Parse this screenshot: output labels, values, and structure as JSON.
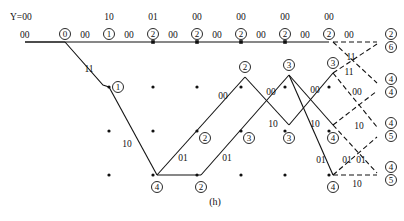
{
  "diagram": {
    "type": "viterbi-trellis",
    "caption": "(h)",
    "received_label": "Y=00",
    "received_sequence": [
      "00",
      "10",
      "01",
      "00",
      "00",
      "00",
      "00"
    ],
    "upper_labels": [
      "Y=00",
      "10",
      "01",
      "00",
      "00",
      "00",
      "00"
    ],
    "lower_labels": [
      "00",
      "00",
      "00",
      "00",
      "00",
      "00",
      "00",
      "00"
    ],
    "columns_x": [
      65,
      109,
      153,
      197,
      241,
      285,
      329,
      373
    ],
    "rows_y": [
      42,
      87,
      131,
      175
    ],
    "survivor_edges": [
      {
        "from": [
          0,
          0
        ],
        "to": [
          1,
          0
        ],
        "label": "00"
      },
      {
        "from": [
          1,
          0
        ],
        "to": [
          2,
          0
        ],
        "label": "00"
      },
      {
        "from": [
          2,
          0
        ],
        "to": [
          3,
          0
        ],
        "label": "00"
      },
      {
        "from": [
          3,
          0
        ],
        "to": [
          4,
          0
        ],
        "label": "00"
      },
      {
        "from": [
          4,
          0
        ],
        "to": [
          5,
          0
        ],
        "label": "00"
      },
      {
        "from": [
          5,
          0
        ],
        "to": [
          6,
          0
        ],
        "label": "00"
      },
      {
        "from": [
          0,
          0
        ],
        "to": [
          1,
          1
        ],
        "label": "11"
      },
      {
        "from": [
          1,
          1
        ],
        "to": [
          2,
          3
        ],
        "label": "10"
      },
      {
        "from": [
          2,
          3
        ],
        "to": [
          3,
          3
        ],
        "label": ""
      },
      {
        "from": [
          2,
          3
        ],
        "to": [
          4,
          1
        ],
        "label": "01"
      },
      {
        "from": [
          3,
          3
        ],
        "to": [
          5,
          1
        ],
        "label": "01"
      },
      {
        "from": [
          4,
          1
        ],
        "to": [
          5,
          2
        ],
        "label": "10"
      },
      {
        "from": [
          5,
          1
        ],
        "to": [
          6,
          2
        ],
        "label": "10"
      },
      {
        "from": [
          5,
          1
        ],
        "to": [
          6,
          3
        ],
        "label": "01"
      },
      {
        "from": [
          4,
          1
        ],
        "to": [
          5,
          1
        ],
        "label": "00"
      },
      {
        "from": [
          5,
          2
        ],
        "to": [
          6,
          1
        ],
        "label": "00"
      }
    ],
    "dashed_edges": [
      {
        "from": [
          6,
          0
        ],
        "to": [
          7,
          0
        ],
        "label": "00"
      },
      {
        "from": [
          6,
          0
        ],
        "to": [
          7,
          1
        ],
        "label": "11"
      },
      {
        "from": [
          6,
          1
        ],
        "to": [
          7,
          0
        ],
        "label": "11"
      },
      {
        "from": [
          6,
          1
        ],
        "to": [
          7,
          2
        ],
        "label": "00"
      },
      {
        "from": [
          6,
          2
        ],
        "to": [
          7,
          1
        ],
        "label": "10"
      },
      {
        "from": [
          6,
          2
        ],
        "to": [
          7,
          3
        ],
        "label": "01"
      },
      {
        "from": [
          6,
          3
        ],
        "to": [
          7,
          2
        ],
        "label": "01"
      },
      {
        "from": [
          6,
          3
        ],
        "to": [
          7,
          3
        ],
        "label": "10"
      }
    ],
    "node_metrics": [
      {
        "col": 0,
        "row": 0,
        "value": "0"
      },
      {
        "col": 1,
        "row": 0,
        "value": "1"
      },
      {
        "col": 2,
        "row": 0,
        "value": "2"
      },
      {
        "col": 3,
        "row": 0,
        "value": "2"
      },
      {
        "col": 4,
        "row": 0,
        "value": "2"
      },
      {
        "col": 5,
        "row": 0,
        "value": "2"
      },
      {
        "col": 6,
        "row": 0,
        "value": "2"
      },
      {
        "col": 1,
        "row": 1,
        "value": "1"
      },
      {
        "col": 2,
        "row": 3,
        "value": "4"
      },
      {
        "col": 3,
        "row": 3,
        "value": "2"
      },
      {
        "col": 3,
        "row": 2,
        "value": "2"
      },
      {
        "col": 4,
        "row": 1,
        "value": "2"
      },
      {
        "col": 4,
        "row": 2,
        "value": "3"
      },
      {
        "col": 5,
        "row": 1,
        "value": "3"
      },
      {
        "col": 5,
        "row": 2,
        "value": "3"
      },
      {
        "col": 6,
        "row": 1,
        "value": "3"
      },
      {
        "col": 6,
        "row": 2,
        "value": "4"
      },
      {
        "col": 6,
        "row": 3,
        "value": "4"
      }
    ],
    "final_metrics": [
      {
        "row": 0,
        "values": [
          "2",
          "6"
        ]
      },
      {
        "row": 1,
        "values": [
          "4",
          "4"
        ]
      },
      {
        "row": 2,
        "values": [
          "4",
          "5"
        ]
      },
      {
        "row": 3,
        "values": [
          "4",
          "5"
        ]
      }
    ]
  }
}
